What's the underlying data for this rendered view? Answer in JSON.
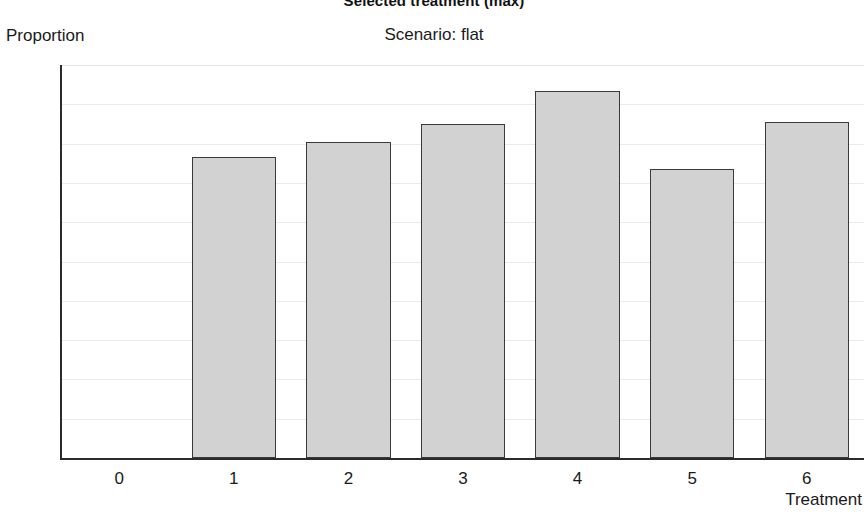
{
  "chart_data": {
    "type": "bar",
    "title": "Selected treatment (max)",
    "subtitle": "Scenario: flat",
    "xlabel": "Treatment",
    "ylabel": "Proportion",
    "categories": [
      "0",
      "1",
      "2",
      "3",
      "4",
      "5",
      "6"
    ],
    "values": [
      0,
      0.153,
      0.161,
      0.17,
      0.187,
      0.147,
      0.171
    ],
    "ylim": [
      0,
      0.2
    ],
    "xlim": [
      -0.5,
      6.5
    ],
    "yticks": [
      0,
      0.02,
      0.04,
      0.06,
      0.08,
      0.1,
      0.12,
      0.14,
      0.16,
      0.18,
      0.2
    ],
    "ytick_labels": [
      "0",
      "0.02",
      "0.04",
      "0.06",
      "0.08",
      "0.1",
      "0.12",
      "0.14",
      "0.16",
      "0.18",
      "0.2"
    ],
    "xtick_labels": [
      "0",
      "1",
      "2",
      "3",
      "4",
      "5",
      "6"
    ],
    "grid": true,
    "grid_axis": "y",
    "legend": false,
    "bar_fill": "#d2d2d2",
    "bar_edge": "#3a3a3a",
    "axis_color": "#2b2b2b",
    "grid_color": "#ebebeb",
    "background": "#ffffff"
  }
}
